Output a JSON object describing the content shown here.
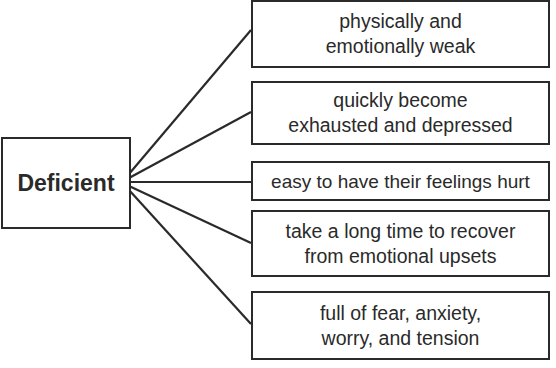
{
  "diagram": {
    "root": {
      "label": "Deficient"
    },
    "children": [
      {
        "label": "physically and\nemotionally weak"
      },
      {
        "label": "quickly become\nexhausted and depressed"
      },
      {
        "label": "easy to have their feelings hurt"
      },
      {
        "label": "take a long time to recover\nfrom emotional upsets"
      },
      {
        "label": "full of fear, anxiety,\nworry, and tension"
      }
    ],
    "colors": {
      "stroke": "#2a2a2a",
      "background": "#ffffff",
      "text": "#2a2a2a"
    }
  }
}
